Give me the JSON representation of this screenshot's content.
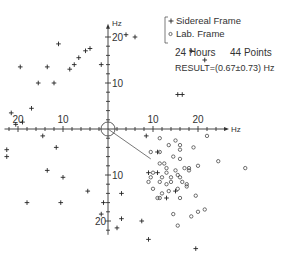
{
  "chart_data": {
    "type": "scatter",
    "title": "",
    "xlabel": "Hz",
    "ylabel": "Hz",
    "xlim": [
      -23,
      26
    ],
    "ylim": [
      -23,
      22
    ],
    "x_ticks": [
      -20,
      -10,
      10,
      20
    ],
    "x_tick_labels": [
      "20",
      "10",
      "10",
      "20"
    ],
    "y_ticks": [
      20,
      10,
      -10,
      -20
    ],
    "y_tick_labels": [
      "20",
      "10",
      "10",
      "20"
    ],
    "grid": false,
    "legend": {
      "position": "upper right",
      "entries": [
        {
          "marker": "+",
          "label": "Sidereal Frame"
        },
        {
          "marker": "o",
          "label": "Lab. Frame"
        }
      ]
    },
    "annotations": [
      "24 Hours",
      "44 Points",
      "RESULT=(0.67±0.73) Hz"
    ],
    "result_vector": {
      "from": [
        0,
        0
      ],
      "to": [
        9.5,
        -6.5
      ]
    },
    "origin_circle_radius": 1.2,
    "series": [
      {
        "name": "Sidereal Frame",
        "marker": "+",
        "points": [
          [
            -19.5,
            13.5
          ],
          [
            -15.5,
            10.0
          ],
          [
            -13.5,
            13.5
          ],
          [
            -12.0,
            10.0
          ],
          [
            -11.0,
            18.5
          ],
          [
            -8.5,
            13.0
          ],
          [
            -7.5,
            14.0
          ],
          [
            -6.5,
            15.5
          ],
          [
            -5.0,
            17.0
          ],
          [
            -4.0,
            17.5
          ],
          [
            -1.5,
            14.0
          ],
          [
            4.0,
            20.5
          ],
          [
            6.0,
            20.0
          ],
          [
            18.5,
            17.0
          ],
          [
            21.5,
            15.0
          ],
          [
            15.5,
            7.5
          ],
          [
            16.5,
            7.5
          ],
          [
            -21.5,
            3.5
          ],
          [
            -19.0,
            1.5
          ],
          [
            -17.0,
            4.5
          ],
          [
            -20.5,
            1.0
          ],
          [
            -14.5,
            -1.5
          ],
          [
            -22.5,
            -4.5
          ],
          [
            -22.5,
            -6.0
          ],
          [
            -13.5,
            -9.0
          ],
          [
            -11.5,
            -4.0
          ],
          [
            -10.0,
            -10.5
          ],
          [
            -18.0,
            -16.0
          ],
          [
            -10.5,
            -16.0
          ],
          [
            -1.0,
            -16.0
          ],
          [
            -1.5,
            -18.5
          ],
          [
            3.0,
            -14.0
          ],
          [
            3.0,
            -19.5
          ],
          [
            2.0,
            -21.5
          ],
          [
            7.5,
            -20.0
          ],
          [
            8.5,
            -1.5
          ],
          [
            11.0,
            -5.0
          ],
          [
            9.0,
            -9.5
          ],
          [
            11.0,
            -9.5
          ],
          [
            13.0,
            -15.0
          ],
          [
            9.0,
            -24.0
          ],
          [
            19.5,
            -26.0
          ],
          [
            -4.5,
            -13.5
          ],
          [
            15.0,
            -13.5
          ]
        ]
      },
      {
        "name": "Lab. Frame",
        "marker": "o",
        "points": [
          [
            11.5,
            -2.0
          ],
          [
            15.0,
            -2.5
          ],
          [
            13.5,
            -3.5
          ],
          [
            16.0,
            -3.5
          ],
          [
            16.0,
            -4.5
          ],
          [
            19.0,
            -4.0
          ],
          [
            22.0,
            -1.5
          ],
          [
            9.5,
            -5.0
          ],
          [
            11.5,
            -5.0
          ],
          [
            14.5,
            -6.0
          ],
          [
            16.0,
            -6.5
          ],
          [
            24.5,
            -7.0
          ],
          [
            20.0,
            -8.0
          ],
          [
            30.5,
            -8.5
          ],
          [
            11.5,
            -7.5
          ],
          [
            12.5,
            -7.5
          ],
          [
            13.0,
            -8.5
          ],
          [
            17.0,
            -8.5
          ],
          [
            18.0,
            -8.5
          ],
          [
            18.0,
            -9.0
          ],
          [
            10.0,
            -9.5
          ],
          [
            13.0,
            -9.5
          ],
          [
            15.0,
            -9.0
          ],
          [
            15.5,
            -10.0
          ],
          [
            9.5,
            -10.5
          ],
          [
            12.0,
            -10.5
          ],
          [
            14.0,
            -10.5
          ],
          [
            16.0,
            -10.5
          ],
          [
            9.0,
            -11.5
          ],
          [
            11.5,
            -11.5
          ],
          [
            14.0,
            -11.5
          ],
          [
            16.5,
            -11.5
          ],
          [
            13.0,
            -12.0
          ],
          [
            17.5,
            -12.0
          ],
          [
            10.0,
            -13.0
          ],
          [
            12.0,
            -14.0
          ],
          [
            13.5,
            -13.5
          ],
          [
            15.5,
            -13.0
          ],
          [
            17.5,
            -12.5
          ],
          [
            16.0,
            -15.0
          ],
          [
            19.5,
            -14.5
          ],
          [
            11.0,
            -15.0
          ],
          [
            11.5,
            -15.0
          ],
          [
            14.5,
            -18.5
          ],
          [
            18.5,
            -19.0
          ],
          [
            20.0,
            -18.0
          ],
          [
            21.5,
            -17.5
          ],
          [
            15.5,
            -21.0
          ]
        ]
      }
    ]
  }
}
